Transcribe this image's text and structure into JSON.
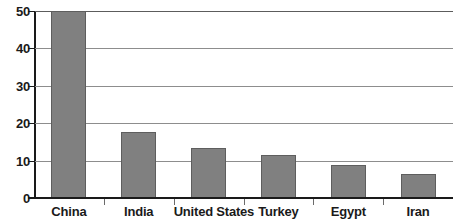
{
  "chart_data": {
    "type": "bar",
    "title": "",
    "subtitle": "",
    "xlabel": "",
    "ylabel": "",
    "categories": [
      "China",
      "India",
      "United States",
      "Turkey",
      "Egypt",
      "Iran"
    ],
    "values": [
      50,
      17.6,
      13.3,
      11.5,
      8.7,
      6.3
    ],
    "series": [
      {
        "name": "",
        "values": [
          50,
          17.6,
          13.3,
          11.5,
          8.7,
          6.3
        ]
      }
    ],
    "ylim": [
      0,
      50
    ],
    "yticks": [
      0,
      10,
      20,
      30,
      40,
      50
    ],
    "ytick_labels": [
      "0",
      "10",
      "20",
      "30",
      "40",
      "50"
    ],
    "grid": true,
    "grid_axis": "y",
    "legend": false,
    "legend_position": "none",
    "bar_color": "#808080",
    "bar_edge_color": "#5e5e5e",
    "gridline_color": "#8d8d8d",
    "axis_color": "#1a1a1a",
    "background_color": "#ffffff",
    "annotations": []
  }
}
